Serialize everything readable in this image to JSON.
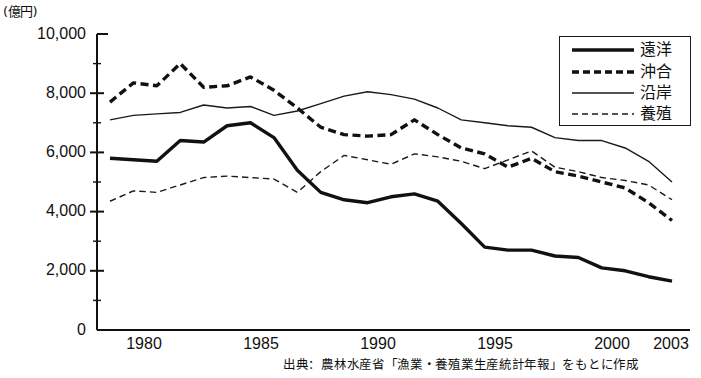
{
  "chart_data": {
    "type": "line",
    "title": "",
    "subtitle": "",
    "unit_label": "(億円)",
    "xlabel": "",
    "ylabel": "",
    "ylim": [
      0,
      10000
    ],
    "xlim": [
      1979,
      2003
    ],
    "grid": false,
    "legend_position": "top-right",
    "y_ticks": [
      "0",
      "2,000",
      "4,000",
      "6,000",
      "8,000",
      "10,000"
    ],
    "y_tick_values": [
      0,
      2000,
      4000,
      6000,
      8000,
      10000
    ],
    "y_minor_ticks": [
      1000,
      3000,
      5000,
      7000,
      9000
    ],
    "x_ticks": [
      "1980",
      "1985",
      "1990",
      "1995",
      "2000",
      "2003"
    ],
    "x_tick_values": [
      1980,
      1985,
      1990,
      1995,
      2000,
      2003
    ],
    "x": [
      1979,
      1980,
      1981,
      1982,
      1983,
      1984,
      1985,
      1986,
      1987,
      1988,
      1989,
      1990,
      1991,
      1992,
      1993,
      1994,
      1995,
      1996,
      1997,
      1998,
      1999,
      2000,
      2001,
      2002,
      2003
    ],
    "series": [
      {
        "name": "遠洋",
        "style": "thick-solid",
        "color": "#111111",
        "values": [
          5800,
          5750,
          5700,
          6400,
          6350,
          6900,
          7000,
          6500,
          5400,
          4650,
          4400,
          4300,
          4500,
          4600,
          4350,
          3600,
          2800,
          2700,
          2700,
          2500,
          2450,
          2100,
          2000,
          1800,
          1650
        ]
      },
      {
        "name": "沖合",
        "style": "thick-dashed",
        "color": "#111111",
        "values": [
          7700,
          8350,
          8250,
          9000,
          8200,
          8250,
          8550,
          8100,
          7500,
          6850,
          6600,
          6550,
          6600,
          7100,
          6600,
          6150,
          5950,
          5500,
          5800,
          5350,
          5200,
          5000,
          4800,
          4300,
          3700
        ]
      },
      {
        "name": "沿岸",
        "style": "thin-solid",
        "color": "#1a1a1a",
        "values": [
          7100,
          7250,
          7300,
          7350,
          7600,
          7500,
          7550,
          7250,
          7400,
          7650,
          7900,
          8050,
          7950,
          7800,
          7500,
          7100,
          7000,
          6900,
          6850,
          6500,
          6400,
          6400,
          6150,
          5700,
          5000
        ]
      },
      {
        "name": "養殖",
        "style": "thin-dashed",
        "color": "#1a1a1a",
        "values": [
          4350,
          4700,
          4650,
          4900,
          5150,
          5200,
          5150,
          5100,
          4650,
          5350,
          5900,
          5750,
          5600,
          5950,
          5850,
          5700,
          5450,
          5750,
          6050,
          5500,
          5350,
          5150,
          5050,
          4900,
          4400
        ]
      }
    ],
    "source_note": "出典：農林水産省「漁業・養殖業生産統計年報」をもとに作成"
  },
  "legend": {
    "items": [
      {
        "label": "遠洋",
        "style": "thick-solid"
      },
      {
        "label": "沖合",
        "style": "thick-dashed"
      },
      {
        "label": "沿岸",
        "style": "thin-solid"
      },
      {
        "label": "養殖",
        "style": "thin-dashed"
      }
    ]
  },
  "axis": {
    "unit": "(億円)"
  }
}
